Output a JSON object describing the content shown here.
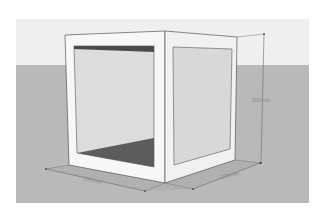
{
  "scene": {
    "description": "3D box model with one open face, SketchUp-style render",
    "colors": {
      "background": "#ffffff",
      "sky": "#eeeeee",
      "ground": "#b8b8b8",
      "face_light": "#f6f6f6",
      "face_side": "#efefef",
      "inner_panel": "#d9d9d9",
      "inner_back": "#dadada",
      "inner_floor": "#5a5a5a",
      "inner_top": "#4a4a4a",
      "edge": "#555555",
      "dimension_line": "#6a6a6a"
    }
  },
  "dimensions": {
    "height": {
      "label": "200mm"
    },
    "width": {
      "label": "200mm"
    },
    "depth": {
      "label": "200mm"
    }
  }
}
